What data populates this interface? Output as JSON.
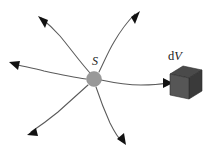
{
  "figure": {
    "background_color": "#ffffff",
    "width": 212,
    "height": 156
  },
  "source": {
    "label": "S",
    "label_style": "italic",
    "center_x": 94,
    "center_y": 79,
    "radius": 7.5,
    "fill_color": "#999999"
  },
  "volume_element": {
    "label_d": "d",
    "label_v": "V",
    "label_full": "dV",
    "front_face_color": "#565656",
    "top_face_color": "#4a4a4a",
    "side_face_color": "#3a3a3a",
    "center_x": 186,
    "center_y": 82
  },
  "rays": [
    {
      "name": "ray-up-left",
      "direction": "up-left",
      "tip_x": 38,
      "tip_y": 16,
      "path": "M 90,73 C 80,62 70,48 60,36 C 53,28 46,22 41,18",
      "head_angle_deg": 220
    },
    {
      "name": "ray-up-right",
      "direction": "up-right",
      "tip_x": 138,
      "tip_y": 12,
      "path": "M 99,72 C 104,62 108,52 114,42 C 121,30 129,20 135,14",
      "head_angle_deg": 312
    },
    {
      "name": "ray-left",
      "direction": "left",
      "tip_x": 10,
      "tip_y": 63,
      "path": "M 86,79 C 72,77 58,74 44,71 C 32,68 22,66 14,64",
      "head_angle_deg": 190
    },
    {
      "name": "ray-right-to-volume",
      "direction": "right",
      "tip_x": 171,
      "tip_y": 83,
      "path": "M 101,80 C 115,83 128,85 141,85 C 152,85 162,84 167,83",
      "head_angle_deg": 356
    },
    {
      "name": "ray-down-left",
      "direction": "down-left",
      "tip_x": 28,
      "tip_y": 134,
      "path": "M 88,85 C 78,94 68,103 58,112 C 47,121 37,128 31,132",
      "head_angle_deg": 133
    },
    {
      "name": "ray-down-right",
      "direction": "down-right",
      "tip_x": 124,
      "tip_y": 143,
      "path": "M 96,87 C 100,99 105,112 110,123 C 115,133 119,139 122,141",
      "head_angle_deg": 68
    }
  ]
}
